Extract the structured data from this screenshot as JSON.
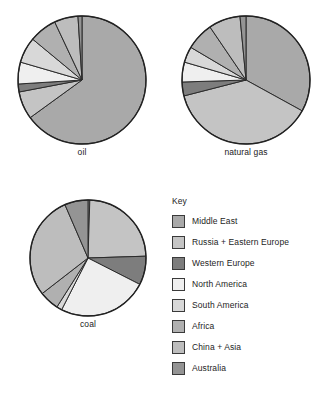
{
  "legend": {
    "title": "Key",
    "items": [
      {
        "label": "Middle East",
        "color": "#a9a9a9"
      },
      {
        "label": "Russia + Eastern Europe",
        "color": "#c4c4c4"
      },
      {
        "label": "Western Europe",
        "color": "#7d7d7d"
      },
      {
        "label": "North America",
        "color": "#efefef"
      },
      {
        "label": "South America",
        "color": "#d8d8d8"
      },
      {
        "label": "Africa",
        "color": "#b0b0b0"
      },
      {
        "label": "China + Asia",
        "color": "#bdbdbd"
      },
      {
        "label": "Australia",
        "color": "#949494"
      }
    ]
  },
  "charts": [
    {
      "id": "oil",
      "caption": "oil",
      "cx": 66,
      "cy": 66,
      "r": 64
    },
    {
      "id": "natural-gas",
      "caption": "natural gas",
      "cx": 66,
      "cy": 66,
      "r": 64
    },
    {
      "id": "coal",
      "caption": "coal",
      "cx": 60,
      "cy": 60,
      "r": 58
    }
  ],
  "chart_data": [
    {
      "type": "pie",
      "title": "oil",
      "categories": [
        "Middle East",
        "Russia + Eastern Europe",
        "Western Europe",
        "North America",
        "South America",
        "Africa",
        "China + Asia",
        "Australia"
      ],
      "values": [
        65.0,
        7.0,
        2.0,
        5.5,
        6.5,
        7.0,
        6.0,
        1.0
      ],
      "unit": "% of world reserves",
      "start_angle": 90,
      "direction": "clockwise",
      "legend": "shared"
    },
    {
      "type": "pie",
      "title": "natural gas",
      "categories": [
        "Middle East",
        "Russia + Eastern Europe",
        "Western Europe",
        "North America",
        "South America",
        "Africa",
        "China + Asia",
        "Australia"
      ],
      "values": [
        33.0,
        38.0,
        3.5,
        5.0,
        4.0,
        7.0,
        8.0,
        1.5
      ],
      "unit": "% of world reserves",
      "start_angle": 90,
      "direction": "clockwise",
      "legend": "shared"
    },
    {
      "type": "pie",
      "title": "coal",
      "categories": [
        "Middle East",
        "Russia + Eastern Europe",
        "Western Europe",
        "North America",
        "South America",
        "Africa",
        "China + Asia",
        "Australia"
      ],
      "values": [
        0.5,
        24.0,
        8.0,
        25.0,
        1.5,
        5.5,
        29.0,
        6.5
      ],
      "unit": "% of world reserves",
      "start_angle": 90,
      "direction": "clockwise",
      "legend": "shared"
    }
  ]
}
